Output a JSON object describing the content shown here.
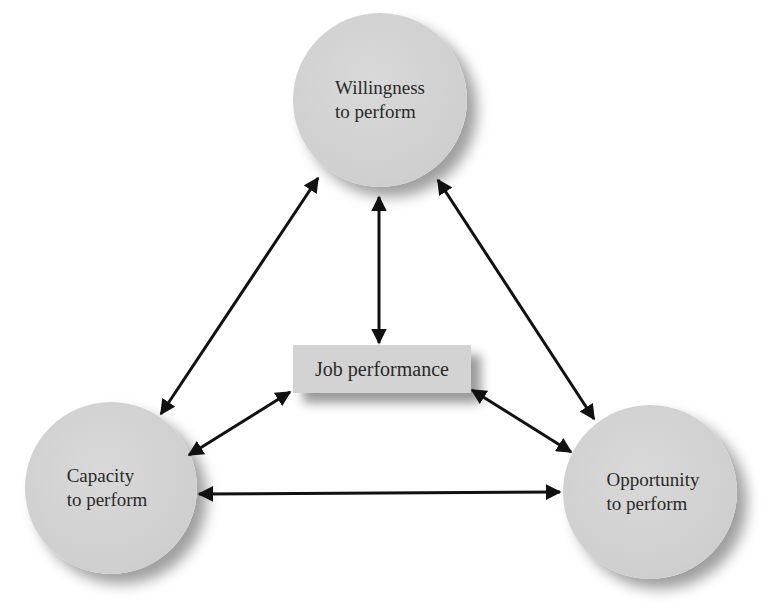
{
  "diagram": {
    "type": "relationship-triangle",
    "colors": {
      "background": "#ffffff",
      "node_fill": "#d3d3d3",
      "arrow": "#111111",
      "text": "#2a2a2a"
    },
    "nodes": {
      "top": {
        "label": "Willingness\nto perform"
      },
      "left": {
        "label": "Capacity\nto perform"
      },
      "right": {
        "label": "Opportunity\nto perform"
      },
      "center": {
        "label": "Job performance"
      }
    },
    "edges": [
      {
        "from": "Willingness to perform",
        "to": "Capacity to perform",
        "type": "bidirectional"
      },
      {
        "from": "Willingness to perform",
        "to": "Opportunity to perform",
        "type": "bidirectional"
      },
      {
        "from": "Willingness to perform",
        "to": "Job performance",
        "type": "bidirectional"
      },
      {
        "from": "Capacity to perform",
        "to": "Job performance",
        "type": "bidirectional"
      },
      {
        "from": "Opportunity to perform",
        "to": "Job performance",
        "type": "bidirectional"
      },
      {
        "from": "Capacity to perform",
        "to": "Opportunity to perform",
        "type": "bidirectional"
      }
    ]
  }
}
